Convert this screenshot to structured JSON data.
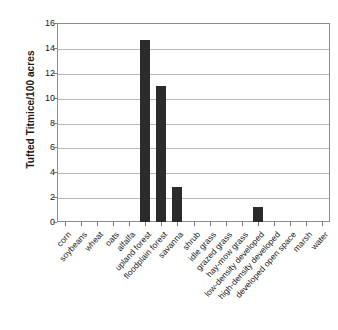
{
  "chart_data": {
    "type": "bar",
    "title": "",
    "xlabel": "",
    "ylabel": "Tufted Titmice/100 acres",
    "ylim": [
      0,
      16
    ],
    "yticks": [
      0,
      2,
      4,
      6,
      8,
      10,
      12,
      14,
      16
    ],
    "grid": true,
    "legend": false,
    "bar_color": "#2b2b2b",
    "categories": [
      "corn",
      "soybeans",
      "wheat",
      "oats",
      "alfalfa",
      "upland forest",
      "floodplain forest",
      "savanna",
      "shrub",
      "idle grass",
      "grazed grass",
      "hay-mow grass",
      "low-density developed",
      "high-density developed",
      "developed open space",
      "marsh",
      "water"
    ],
    "values": [
      0,
      0,
      0,
      0,
      0,
      14.6,
      10.9,
      2.8,
      0,
      0,
      0,
      0,
      1.2,
      0,
      0,
      0,
      0
    ]
  },
  "axis": {
    "y_tick_labels": [
      "16",
      "14",
      "12",
      "10",
      "8",
      "6",
      "4",
      "2",
      "0"
    ]
  }
}
